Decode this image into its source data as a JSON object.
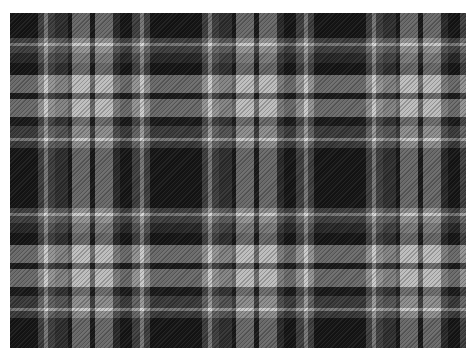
{
  "image": {
    "subject": "black, grey and white tartan plaid fabric",
    "background_color": "#ffffff",
    "base_color": "#1e1e1e",
    "offset": {
      "x": 10,
      "y": 13
    },
    "size": {
      "width": 456,
      "height": 335
    }
  },
  "sett": {
    "period_x": 164,
    "period_y": 170,
    "warp_stripes": [
      {
        "start": 0,
        "end": 28,
        "color": "#161616"
      },
      {
        "start": 28,
        "end": 34,
        "color": "#6a6a6a"
      },
      {
        "start": 34,
        "end": 38,
        "color": "#d8d8d8"
      },
      {
        "start": 38,
        "end": 45,
        "color": "#6a6a6a"
      },
      {
        "start": 45,
        "end": 58,
        "color": "#4a4a4a"
      },
      {
        "start": 58,
        "end": 62,
        "color": "#1a1a1a"
      },
      {
        "start": 62,
        "end": 80,
        "color": "#bdbdbd"
      },
      {
        "start": 80,
        "end": 85,
        "color": "#1c1c1c"
      },
      {
        "start": 85,
        "end": 103,
        "color": "#bdbdbd"
      },
      {
        "start": 103,
        "end": 110,
        "color": "#3e3e3e"
      },
      {
        "start": 110,
        "end": 122,
        "color": "#161616"
      },
      {
        "start": 122,
        "end": 130,
        "color": "#6a6a6a"
      },
      {
        "start": 130,
        "end": 134,
        "color": "#d8d8d8"
      },
      {
        "start": 134,
        "end": 140,
        "color": "#6a6a6a"
      },
      {
        "start": 140,
        "end": 164,
        "color": "#161616"
      }
    ],
    "weft_stripes": [
      {
        "start": 0,
        "end": 25,
        "color": "#161616"
      },
      {
        "start": 25,
        "end": 30,
        "color": "#6a6a6a"
      },
      {
        "start": 30,
        "end": 33,
        "color": "#d8d8d8"
      },
      {
        "start": 33,
        "end": 40,
        "color": "#6a6a6a"
      },
      {
        "start": 40,
        "end": 50,
        "color": "#3a3a3a"
      },
      {
        "start": 50,
        "end": 62,
        "color": "#161616"
      },
      {
        "start": 62,
        "end": 80,
        "color": "#bdbdbd"
      },
      {
        "start": 80,
        "end": 86,
        "color": "#1c1c1c"
      },
      {
        "start": 86,
        "end": 104,
        "color": "#bdbdbd"
      },
      {
        "start": 104,
        "end": 113,
        "color": "#1e1e1e"
      },
      {
        "start": 113,
        "end": 125,
        "color": "#5e5e5e"
      },
      {
        "start": 125,
        "end": 128,
        "color": "#d8d8d8"
      },
      {
        "start": 128,
        "end": 135,
        "color": "#5e5e5e"
      },
      {
        "start": 135,
        "end": 170,
        "color": "#161616"
      }
    ]
  }
}
